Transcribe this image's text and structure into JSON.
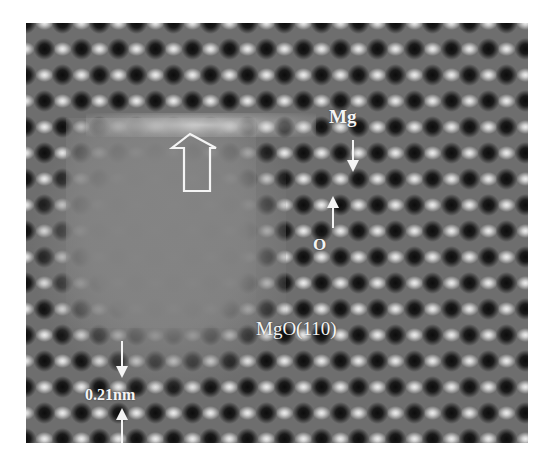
{
  "figure": {
    "type": "HRTEM lattice image",
    "labels": {
      "mg": "Mg",
      "o": "O",
      "plane": "MgO(110)",
      "scale": "0.21nm"
    },
    "annotations": [
      {
        "kind": "hollow-arrow",
        "direction": "up",
        "meaning": "amorphous / disordered region boundary"
      },
      {
        "kind": "arrow",
        "direction": "down",
        "target": "Mg column"
      },
      {
        "kind": "arrow",
        "direction": "up",
        "target": "O column"
      },
      {
        "kind": "arrow-pair",
        "direction": "inward",
        "target": "lattice spacing 0.21nm"
      }
    ],
    "colors": {
      "background": "#ffffff",
      "label": "#f4f4f4",
      "atom_dark": "#0c0c0c",
      "atom_bright": "#eeeeee",
      "amorphous": "#808080"
    }
  }
}
